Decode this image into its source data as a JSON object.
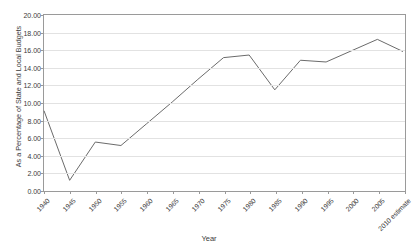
{
  "chart_data": {
    "type": "line",
    "title": "",
    "xlabel": "Year",
    "ylabel": "As a Percentage of State and Local Budgets",
    "categories": [
      "1940",
      "1945",
      "1950",
      "1955",
      "1960",
      "1965",
      "1970",
      "1975",
      "1980",
      "1985",
      "1990",
      "1995",
      "2000",
      "2005",
      "2010 estimate"
    ],
    "values": [
      9.0,
      1.0,
      5.4,
      5.0,
      7.5,
      10.0,
      12.6,
      15.1,
      15.4,
      11.4,
      14.8,
      14.6,
      15.9,
      17.2,
      15.8
    ],
    "ylim": [
      0,
      20
    ],
    "ytick_step": 2,
    "ytick_labels": [
      "0.00",
      "2.00",
      "4.00",
      "6.00",
      "8.00",
      "10.00",
      "12.00",
      "14.00",
      "16.00",
      "18.00",
      "20.00"
    ],
    "grid": true,
    "grid_axis": "y",
    "legend": false,
    "legend_position": "none",
    "series_color": "#6b6b6b",
    "grid_color": "#e2e2e2",
    "axis_color": "#9a9a9a",
    "text_color": "#3a3a3a",
    "marker": "none"
  },
  "axes": {
    "x_title": "Year",
    "y_title": "As a Percentage of State and Local Budgets"
  },
  "header": {
    "title_cropped": ""
  }
}
